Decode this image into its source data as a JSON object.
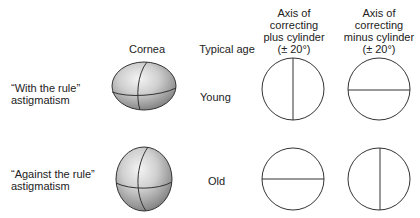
{
  "headers": {
    "cornea": "Cornea",
    "typical_age": "Typical age",
    "plus_cyl": [
      "Axis of",
      "correcting",
      "plus cylinder",
      "(± 20°)"
    ],
    "minus_cyl": [
      "Axis of",
      "correcting",
      "minus cylinder",
      "(± 20°)"
    ]
  },
  "rows": [
    {
      "label": [
        "“With the rule”",
        "astigmatism"
      ],
      "age": "Young",
      "cornea_shape": "oblate-horizontal",
      "plus_axis": "vertical",
      "minus_axis": "horizontal"
    },
    {
      "label": [
        "“Against the rule”",
        "astigmatism"
      ],
      "age": "Old",
      "cornea_shape": "prolate-vertical",
      "plus_axis": "horizontal",
      "minus_axis": "vertical"
    }
  ]
}
